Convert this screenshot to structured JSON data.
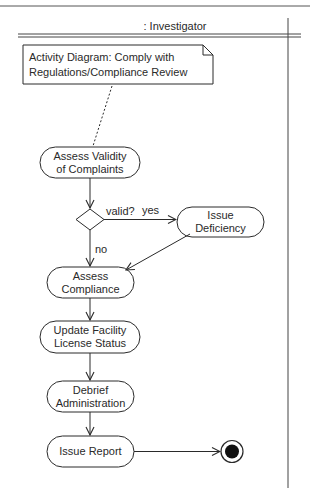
{
  "swimlane": {
    "title": ": Investigator"
  },
  "note": {
    "line1": "Activity Diagram: Comply with",
    "line2": "Regulations/Compliance Review"
  },
  "activities": [
    {
      "id": "assess-validity",
      "line1": "Assess Validity",
      "line2": "of Complaints"
    },
    {
      "id": "issue-deficiency",
      "line1": "Issue",
      "line2": "Deficiency"
    },
    {
      "id": "assess-compliance",
      "line1": "Assess",
      "line2": "Compliance"
    },
    {
      "id": "update-license",
      "line1": "Update Facility",
      "line2": "License Status"
    },
    {
      "id": "debrief-admin",
      "line1": "Debrief",
      "line2": "Administration"
    },
    {
      "id": "issue-report",
      "line1": "Issue Report",
      "line2": ""
    }
  ],
  "decision": {
    "guard": "valid?",
    "yes_label": "yes",
    "no_label": "no"
  },
  "colors": {
    "stroke": "#2a2a2a",
    "background": "#ffffff"
  }
}
